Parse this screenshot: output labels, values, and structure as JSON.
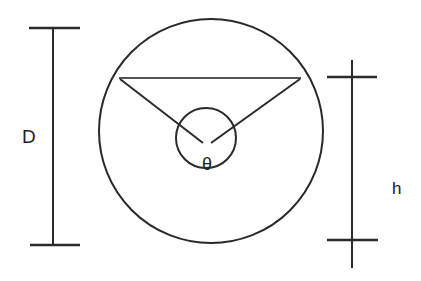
{
  "diagram": {
    "title": "",
    "labels": {
      "diameter": "D",
      "height": "h",
      "angle": "θ"
    },
    "colors": {
      "stroke": "#2a2a2a",
      "chord": "#555555",
      "background": "#ffffff"
    },
    "elements": [
      "outer-circle",
      "inner-circle",
      "chord",
      "radius-lines",
      "diameter-dimension",
      "height-dimension"
    ]
  }
}
